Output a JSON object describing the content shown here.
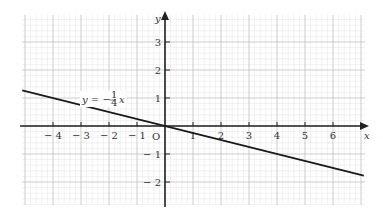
{
  "chart_data": {
    "type": "line",
    "title": "",
    "xlabel": "x",
    "ylabel": "y",
    "xlim": [
      -5.1,
      7.1
    ],
    "ylim": [
      -2.9,
      4.0
    ],
    "grid": true,
    "x_ticks": [
      -4,
      -3,
      -2,
      -1,
      1,
      2,
      3,
      4,
      5,
      6
    ],
    "y_ticks": [
      -2,
      -1,
      1,
      2,
      3
    ],
    "origin_label": "O",
    "series": [
      {
        "name": "y = -1/4 x",
        "equation": "y = -¼ x",
        "slope": -0.25,
        "intercept": 0,
        "x": [
          -5.1,
          7.1
        ],
        "y": [
          1.275,
          -1.775
        ]
      }
    ],
    "annotations": [
      {
        "text": "y = −¼ x",
        "x": -3,
        "y": 1
      }
    ]
  },
  "labels": {
    "x_axis": "x",
    "y_axis": "y",
    "origin": "O",
    "equation_lhs": "y = −",
    "equation_frac_num": "1",
    "equation_frac_den": "4",
    "equation_rhs": "x"
  }
}
